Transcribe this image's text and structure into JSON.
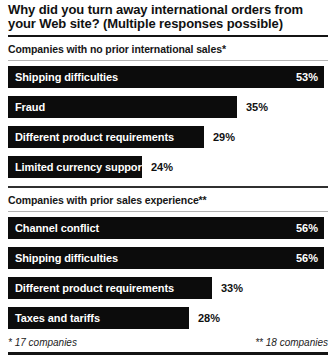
{
  "header": {
    "title": "Why did you turn away international orders from your Web site? (Multiple responses possible)"
  },
  "chart_data": [
    {
      "type": "bar",
      "orientation": "horizontal",
      "title": "Companies with no prior international sales*",
      "categories": [
        "Shipping difficulties",
        "Fraud",
        "Different product requirements",
        "Limited currency support"
      ],
      "values": [
        53,
        35,
        29,
        24
      ],
      "value_suffix": "%",
      "xlim": [
        0,
        56
      ],
      "bar_widths_px": [
        316,
        229,
        196,
        134
      ],
      "bar_color": "#0c0c0c",
      "label_color_inside": "#ffffff",
      "label_color_outside": "#111111"
    },
    {
      "type": "bar",
      "orientation": "horizontal",
      "title": "Companies with prior sales experience**",
      "categories": [
        "Channel conflict",
        "Shipping difficulties",
        "Different product requirements",
        "Taxes and tariffs"
      ],
      "values": [
        56,
        56,
        33,
        28
      ],
      "value_suffix": "%",
      "xlim": [
        0,
        56
      ],
      "bar_widths_px": [
        316,
        316,
        204,
        181
      ],
      "bar_color": "#0c0c0c",
      "label_color_inside": "#ffffff",
      "label_color_outside": "#111111"
    }
  ],
  "footer": {
    "left": "* 17 companies",
    "right": "** 18 companies"
  }
}
